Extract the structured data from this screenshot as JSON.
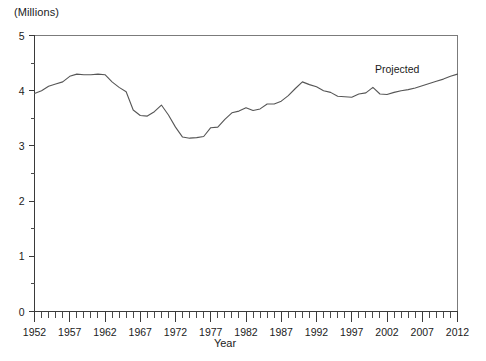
{
  "chart_data": {
    "type": "line",
    "title": "",
    "subtitle": "",
    "unit_label": "(Millions)",
    "xlabel": "Year",
    "ylabel": "",
    "xlim": [
      1952,
      2012
    ],
    "ylim": [
      0,
      5
    ],
    "grid": false,
    "legend_position": "none",
    "y_ticks": [
      0,
      1,
      2,
      3,
      4,
      5
    ],
    "y_tick_labels": [
      "0",
      "1",
      "2",
      "3",
      "4",
      "5"
    ],
    "y_minor_tick_step": 0.5,
    "x_ticks": [
      1952,
      1957,
      1962,
      1967,
      1972,
      1977,
      1982,
      1987,
      1992,
      1997,
      2002,
      2007,
      2012
    ],
    "x_tick_labels": [
      "1952",
      "1957",
      "1962",
      "1967",
      "1972",
      "1977",
      "1982",
      "1987",
      "1992",
      "1997",
      "2002",
      "2007",
      "2012"
    ],
    "x_minor_tick_step": 1,
    "annotations": [
      {
        "text": "Projected",
        "x": 2001,
        "y": 4.55
      }
    ],
    "series": [
      {
        "name": "value",
        "color": "#565656",
        "x": [
          1952,
          1953,
          1954,
          1955,
          1956,
          1957,
          1958,
          1959,
          1960,
          1961,
          1962,
          1963,
          1964,
          1965,
          1966,
          1967,
          1968,
          1969,
          1970,
          1971,
          1972,
          1973,
          1974,
          1975,
          1976,
          1977,
          1978,
          1979,
          1980,
          1981,
          1982,
          1983,
          1984,
          1985,
          1986,
          1987,
          1988,
          1989,
          1990,
          1991,
          1992,
          1993,
          1994,
          1995,
          1996,
          1997,
          1998,
          1999,
          2000,
          2001,
          2002,
          2003,
          2004,
          2005,
          2006,
          2007,
          2008,
          2009,
          2010,
          2011,
          2012
        ],
        "values": [
          3.95,
          4.0,
          4.08,
          4.12,
          4.16,
          4.26,
          4.3,
          4.29,
          4.29,
          4.3,
          4.29,
          4.16,
          4.06,
          3.98,
          3.65,
          3.55,
          3.54,
          3.62,
          3.74,
          3.56,
          3.34,
          3.16,
          3.14,
          3.15,
          3.17,
          3.33,
          3.34,
          3.48,
          3.6,
          3.63,
          3.69,
          3.64,
          3.67,
          3.76,
          3.76,
          3.81,
          3.91,
          4.04,
          4.16,
          4.11,
          4.07,
          4.0,
          3.97,
          3.9,
          3.89,
          3.88,
          3.94,
          3.96,
          4.06,
          3.94,
          3.93,
          3.97,
          4.0,
          4.02,
          4.05,
          4.09,
          4.13,
          4.17,
          4.21,
          4.26,
          4.3
        ]
      }
    ]
  }
}
